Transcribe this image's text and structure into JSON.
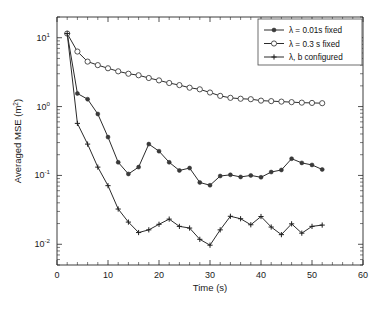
{
  "chart_data": {
    "type": "line",
    "title": "",
    "xlabel": "Time (s)",
    "ylabel": "Averaged MSE (m²)",
    "ylabel_base": "Averaged MSE (m",
    "ylabel_sup": "2",
    "ylabel_close": ")",
    "xlim": [
      0,
      60
    ],
    "ylim": [
      0.005,
      20
    ],
    "yscale": "log",
    "xscale": "linear",
    "grid": false,
    "legend_position": "upper right",
    "xticks": [
      0,
      10,
      20,
      30,
      40,
      50,
      60
    ],
    "xticklabels": [
      "0",
      "10",
      "20",
      "30",
      "40",
      "50",
      "60"
    ],
    "yticks": [
      10,
      1,
      0.1,
      0.01
    ],
    "yticklabels": [
      {
        "base": "10",
        "exp": "1"
      },
      {
        "base": "10",
        "exp": "0"
      },
      {
        "base": "10",
        "exp": "-1"
      },
      {
        "base": "10",
        "exp": "-2"
      }
    ],
    "x": [
      2,
      4,
      6,
      8,
      10,
      12,
      14,
      16,
      18,
      20,
      22,
      24,
      26,
      28,
      30,
      32,
      34,
      36,
      38,
      40,
      42,
      44,
      46,
      48,
      50,
      52
    ],
    "series": [
      {
        "name": "λ = 0.01s fixed",
        "marker": "filled-square",
        "values": [
          11.5,
          1.55,
          1.28,
          0.78,
          0.36,
          0.155,
          0.105,
          0.132,
          0.285,
          0.225,
          0.155,
          0.118,
          0.128,
          0.079,
          0.072,
          0.098,
          0.102,
          0.095,
          0.1,
          0.094,
          0.112,
          0.12,
          0.175,
          0.152,
          0.142,
          0.122
        ]
      },
      {
        "name": "λ = 0.3 s fixed",
        "marker": "open-circle",
        "values": [
          11.5,
          6.3,
          4.5,
          4.0,
          3.6,
          3.25,
          3.0,
          2.85,
          2.6,
          2.4,
          2.2,
          2.05,
          1.88,
          1.78,
          1.6,
          1.43,
          1.34,
          1.3,
          1.28,
          1.22,
          1.2,
          1.18,
          1.16,
          1.14,
          1.13,
          1.12
        ]
      },
      {
        "name": "λ, b configured",
        "marker": "plus",
        "values": [
          11.5,
          0.57,
          0.285,
          0.132,
          0.071,
          0.0325,
          0.021,
          0.0148,
          0.0162,
          0.0195,
          0.0232,
          0.0182,
          0.0172,
          0.0118,
          0.0097,
          0.0162,
          0.0255,
          0.0235,
          0.0192,
          0.0253,
          0.0178,
          0.0138,
          0.0198,
          0.0145,
          0.0182,
          0.019
        ]
      }
    ]
  },
  "legend": {
    "items": [
      {
        "label": "λ = 0.01s fixed",
        "marker": "filled-square"
      },
      {
        "label": "λ = 0.3 s fixed",
        "marker": "open-circle"
      },
      {
        "label": "λ, b configured",
        "marker": "plus"
      }
    ]
  }
}
